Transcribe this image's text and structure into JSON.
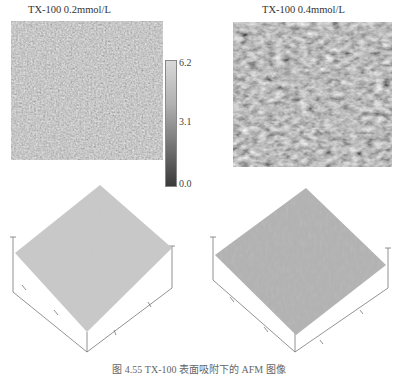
{
  "figure": {
    "panels": [
      {
        "id": "a",
        "title": "TX-100 0.2mmol/L",
        "type": "afm-height-2d"
      },
      {
        "id": "b",
        "title": "TX-100 0.4mmol/L",
        "type": "afm-height-2d"
      },
      {
        "id": "c",
        "type": "afm-surface-3d",
        "source": "TX-100 0.2mmol/L"
      },
      {
        "id": "d",
        "type": "afm-surface-3d",
        "source": "TX-100 0.4mmol/L"
      }
    ],
    "colorbar": {
      "ticks": [
        "6.2",
        "3.1",
        "0.0"
      ],
      "min": 0.0,
      "max": 6.2,
      "colors": {
        "top": "#d8d8d8",
        "bottom": "#3a3a3a"
      }
    },
    "caption": "图 4.55  TX-100 表面吸附下的 AFM 图像"
  }
}
